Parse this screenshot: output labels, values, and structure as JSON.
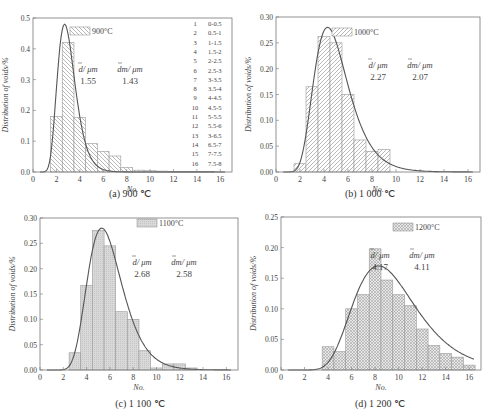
{
  "chart_data": [
    {
      "id": "a",
      "type": "bar",
      "title": "900°C",
      "caption": "(a) 900 ℃",
      "xlabel": "No.",
      "ylabel": "Distribution of voids/%",
      "xlim": [
        0,
        17
      ],
      "ylim": [
        0,
        0.5
      ],
      "xticks": [
        0,
        2,
        4,
        6,
        8,
        10,
        12,
        14,
        16
      ],
      "yticks": [
        0.0,
        0.1,
        0.2,
        0.3,
        0.4,
        0.5
      ],
      "ytick_labels": [
        "0.0",
        "0.1",
        "0.2",
        "0.3",
        "0.4",
        "0.5"
      ],
      "categories": [
        1,
        2,
        3,
        4,
        5,
        6,
        7,
        8,
        9,
        10,
        11,
        12,
        13,
        14,
        15,
        16
      ],
      "values": [
        0.0,
        0.18,
        0.42,
        0.177,
        0.092,
        0.067,
        0.052,
        0.015,
        0.006,
        0.004,
        0.003,
        0.002,
        0.002,
        0.002,
        0.002,
        0.0
      ],
      "fit_peak": {
        "x": 2.7,
        "y": 0.48
      },
      "pattern": "diagonal-back",
      "legend": "900°C",
      "d_mean_label": "d/ μm",
      "d_mean": "1.55",
      "dm_label": "dm/ μm",
      "dm": "1.43",
      "bin_table": [
        [
          "1",
          "0-0.5"
        ],
        [
          "2",
          "0.5-1"
        ],
        [
          "3",
          "1-1.5"
        ],
        [
          "4",
          "1.5-2"
        ],
        [
          "5",
          "2-2.5"
        ],
        [
          "6",
          "2.5-3"
        ],
        [
          "7",
          "3-3.5"
        ],
        [
          "8",
          "3.5-4"
        ],
        [
          "9",
          "4-4.5"
        ],
        [
          "10",
          "4.5-5"
        ],
        [
          "11",
          "5-5.5"
        ],
        [
          "12",
          "5.5-6"
        ],
        [
          "13",
          "3-6.5"
        ],
        [
          "14",
          "6.5-7"
        ],
        [
          "15",
          "7-7.5"
        ],
        [
          "16",
          "7.5-8"
        ]
      ]
    },
    {
      "id": "b",
      "type": "bar",
      "title": "1000°C",
      "caption": "(b) 1 000 ℃",
      "xlabel": "No.",
      "ylabel": "Distribution of voids/%",
      "xlim": [
        0,
        17
      ],
      "ylim": [
        0,
        0.3
      ],
      "xticks": [
        0,
        2,
        4,
        6,
        8,
        10,
        12,
        14,
        16
      ],
      "yticks": [
        0.0,
        0.05,
        0.1,
        0.15,
        0.2,
        0.25,
        0.3
      ],
      "ytick_labels": [
        "0.00",
        "0.05",
        "0.10",
        "0.15",
        "0.20",
        "0.25",
        "0.30"
      ],
      "categories": [
        1,
        2,
        3,
        4,
        5,
        6,
        7,
        8,
        9,
        10,
        11,
        12,
        13,
        14,
        15,
        16
      ],
      "values": [
        0.0,
        0.016,
        0.165,
        0.262,
        0.25,
        0.15,
        0.062,
        0.04,
        0.044,
        0,
        0,
        0,
        0,
        0,
        0,
        0
      ],
      "fit_peak": {
        "x": 4.3,
        "y": 0.28
      },
      "pattern": "diagonal-fwd",
      "legend": "1000°C",
      "d_mean_label": "d/ μm",
      "d_mean": "2.27",
      "dm_label": "dm/ μm",
      "dm": "2.07"
    },
    {
      "id": "c",
      "type": "bar",
      "title": "1100°C",
      "caption": "(c) 1 100 ℃",
      "xlabel": "No.",
      "ylabel": "Distribution of voids/%",
      "xlim": [
        0,
        17
      ],
      "ylim": [
        0,
        0.3
      ],
      "xticks": [
        0,
        2,
        4,
        6,
        8,
        10,
        12,
        14,
        16
      ],
      "yticks": [
        0.0,
        0.05,
        0.1,
        0.15,
        0.2,
        0.25,
        0.3
      ],
      "ytick_labels": [
        "0.00",
        "0.05",
        "0.10",
        "0.15",
        "0.20",
        "0.25",
        "0.30"
      ],
      "categories": [
        1,
        2,
        3,
        4,
        5,
        6,
        7,
        8,
        9,
        10,
        11,
        12,
        13,
        14,
        15,
        16
      ],
      "values": [
        0.0,
        0.0,
        0.034,
        0.167,
        0.275,
        0.245,
        0.115,
        0.1,
        0.038,
        0.004,
        0.012,
        0.012,
        0.004,
        0.0,
        0.0,
        0.0
      ],
      "fit_peak": {
        "x": 5.3,
        "y": 0.28
      },
      "pattern": "fine-grey",
      "legend": "1100°C",
      "d_mean_label": "d/ μm",
      "d_mean": "2.68",
      "dm_label": "dm/ μm",
      "dm": "2.58"
    },
    {
      "id": "d",
      "type": "bar",
      "title": "1200°C",
      "caption": "(d) 1 200 ℃",
      "xlabel": "No.",
      "ylabel": "Distribution of voids/%",
      "xlim": [
        0,
        17
      ],
      "ylim": [
        0,
        0.25
      ],
      "xticks": [
        0,
        2,
        4,
        6,
        8,
        10,
        12,
        14,
        16
      ],
      "yticks": [
        0.0,
        0.05,
        0.1,
        0.15,
        0.2,
        0.25
      ],
      "ytick_labels": [
        "0.00",
        "0.05",
        "0.10",
        "0.15",
        "0.20",
        "0.25"
      ],
      "categories": [
        1,
        2,
        3,
        4,
        5,
        6,
        7,
        8,
        9,
        10,
        11,
        12,
        13,
        14,
        15,
        16
      ],
      "values": [
        0.0,
        0.0,
        0.0,
        0.038,
        0.03,
        0.1,
        0.123,
        0.198,
        0.147,
        0.123,
        0.105,
        0.067,
        0.04,
        0.027,
        0.021,
        0.008
      ],
      "fit_peak": {
        "x": 8.3,
        "y": 0.17
      },
      "pattern": "crosshatch",
      "legend": "1200°C",
      "d_mean_label": "d/ μm",
      "d_mean": "4.17",
      "dm_label": "dm/ μm",
      "dm": "4.11"
    }
  ]
}
